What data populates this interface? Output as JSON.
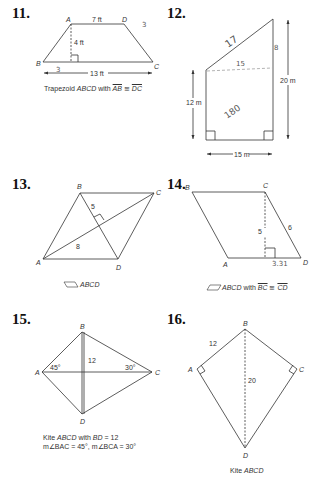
{
  "problems": {
    "p11": {
      "number": "11.",
      "labels": {
        "A": "A",
        "B": "B",
        "C": "C",
        "D": "D"
      },
      "top": "7 ft",
      "height": "4 ft",
      "bottom": "13 ft",
      "caption_prefix": "Trapezoid ",
      "caption_name": "ABCD",
      "caption_with": " with ",
      "seg1": "AB",
      "cong": " ≅ ",
      "seg2": "DC",
      "handwriting": [
        "3",
        "3"
      ]
    },
    "p12": {
      "number": "12.",
      "left": "12 m",
      "right": "20 m",
      "bottom": "15 m",
      "handwriting": [
        "17",
        "15",
        "8",
        "180"
      ]
    },
    "p13": {
      "number": "13.",
      "labels": {
        "A": "A",
        "B": "B",
        "C": "C",
        "D": "D"
      },
      "half_diag": "5",
      "diag": "8",
      "caption": "ABCD"
    },
    "p14": {
      "number": "14.",
      "labels": {
        "A": "A",
        "B": "B",
        "C": "C",
        "D": "D"
      },
      "height": "5",
      "side": "6",
      "caption_name": "ABCD",
      "caption_with": " with ",
      "seg1": "BC",
      "cong": " ≅ ",
      "seg2": "CD",
      "handwriting": [
        "3.31"
      ]
    },
    "p15": {
      "number": "15.",
      "labels": {
        "A": "A",
        "B": "B",
        "C": "C",
        "D": "D"
      },
      "bd": "12",
      "angle_a": "45°",
      "angle_c": "30°",
      "caption_line1_prefix": "Kite ",
      "caption_line1_name": "ABCD",
      "caption_line1_with": " with ",
      "caption_line1_bd": "BD",
      "caption_line1_val": " = 12",
      "caption_line2": "m∠BAC = 45°, m∠BCA = 30°"
    },
    "p16": {
      "number": "16.",
      "labels": {
        "A": "A",
        "B": "B",
        "C": "C",
        "D": "D"
      },
      "ab": "12",
      "bd": "20",
      "caption_prefix": "Kite ",
      "caption_name": "ABCD"
    }
  }
}
